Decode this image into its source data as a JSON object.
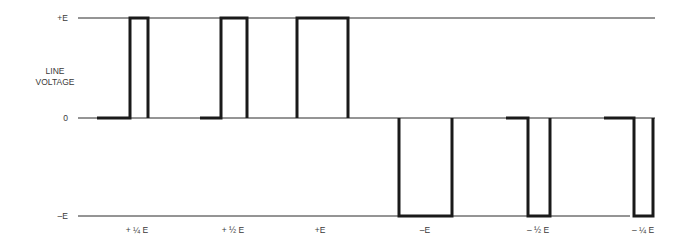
{
  "diagram": {
    "axis_title_line1": "LINE",
    "axis_title_line2": "VOLTAGE",
    "levels": [
      {
        "id": "pos",
        "label": "+E",
        "y": 18,
        "x_start": 78,
        "x_end": 655
      },
      {
        "id": "zero",
        "label": "0",
        "y": 118,
        "x_start": 78,
        "x_end": 655
      },
      {
        "id": "neg",
        "label": "–E",
        "y": 216,
        "x_start": 78,
        "x_end": 630
      }
    ],
    "pulses": [
      {
        "label": "+ ¼ E",
        "polarity": "+",
        "lead_start": 97,
        "rise": 130,
        "fall": 148,
        "label_x": 137
      },
      {
        "label": "+ ½ E",
        "polarity": "+",
        "lead_start": 200,
        "rise": 221,
        "fall": 247,
        "label_x": 233
      },
      {
        "label": "+E",
        "polarity": "+",
        "lead_start": 297,
        "rise": 297,
        "fall": 348,
        "label_x": 320
      },
      {
        "label": "–E",
        "polarity": "-",
        "lead_start": 399,
        "rise": 399,
        "fall": 452,
        "label_x": 425
      },
      {
        "label": "– ½ E",
        "polarity": "-",
        "lead_start": 506,
        "rise": 528,
        "fall": 550,
        "label_x": 538
      },
      {
        "label": "– ¼ E",
        "polarity": "-",
        "lead_start": 604,
        "rise": 634,
        "fall": 653,
        "label_x": 643
      }
    ],
    "colors": {
      "line": "#1a1a1a",
      "thin_line": "#2a2a2a",
      "text": "#3a3a3a"
    }
  }
}
